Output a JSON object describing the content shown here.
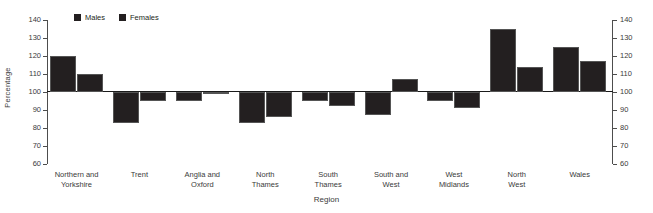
{
  "chart_data": {
    "type": "bar",
    "title": "",
    "xlabel": "Region",
    "ylabel": "Percentage",
    "ylim": [
      60,
      140
    ],
    "ytick_step": 10,
    "yticks": [
      60,
      70,
      80,
      90,
      100,
      110,
      120,
      130,
      140
    ],
    "baseline": 100,
    "grid": false,
    "legend_position": "top-left",
    "dual_axis": true,
    "categories": [
      "Northern and\nYorkshire",
      "Trent",
      "Anglia and\nOxford",
      "North\nThames",
      "South\nThames",
      "South and\nWest",
      "West\nMidlands",
      "North\nWest",
      "Wales"
    ],
    "series": [
      {
        "name": "Males",
        "color": "#231f20",
        "values": [
          120,
          83,
          95,
          83,
          95,
          87,
          95,
          135,
          125
        ]
      },
      {
        "name": "Females",
        "color": "#231f20",
        "values": [
          110,
          95,
          99.5,
          86,
          92,
          107,
          91,
          114,
          117
        ]
      }
    ]
  },
  "axis": {
    "left_label": "Percentage",
    "bottom_label": "Region",
    "tick_labels": [
      "140",
      "130",
      "120",
      "110",
      "100",
      "90",
      "80",
      "70",
      "60"
    ]
  }
}
